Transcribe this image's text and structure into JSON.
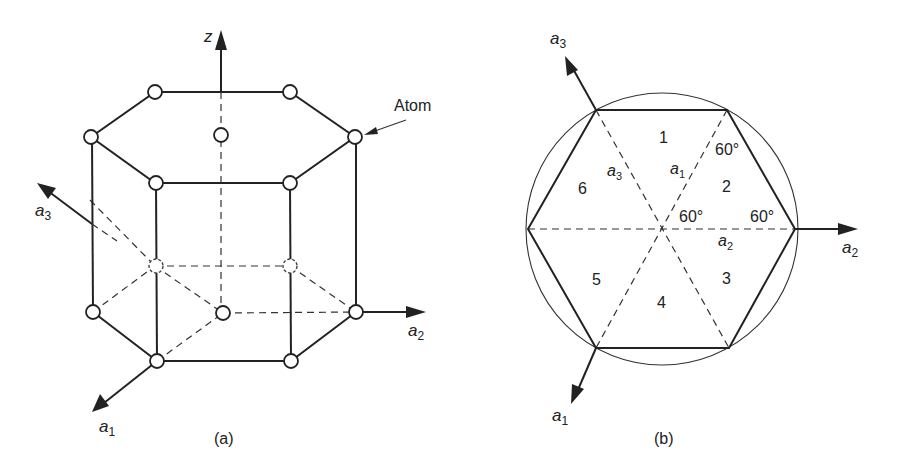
{
  "panel_a": {
    "caption": "(a)",
    "axes": {
      "z": "z",
      "a1": {
        "base": "a",
        "sub": "1"
      },
      "a2": {
        "base": "a",
        "sub": "2"
      },
      "a3": {
        "base": "a",
        "sub": "3"
      }
    },
    "annotation": "Atom"
  },
  "panel_b": {
    "caption": "(b)",
    "axes": {
      "a1": {
        "base": "a",
        "sub": "1"
      },
      "a2": {
        "base": "a",
        "sub": "2"
      },
      "a3": {
        "base": "a",
        "sub": "3"
      }
    },
    "inner_labels": {
      "a1": {
        "base": "a",
        "sub": "1"
      },
      "a2": {
        "base": "a",
        "sub": "2"
      },
      "a3": {
        "base": "a",
        "sub": "3"
      }
    },
    "sectors": [
      "1",
      "2",
      "3",
      "4",
      "5",
      "6"
    ],
    "angles": [
      "60°",
      "60°",
      "60°"
    ]
  }
}
